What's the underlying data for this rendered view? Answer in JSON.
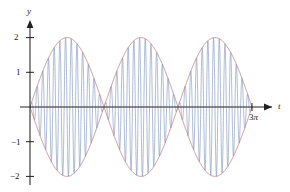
{
  "figure": {
    "background_color": "#ffffff",
    "axis_color": "#231f20",
    "envelope_color": "#c2807e",
    "carrier_color": "#7b92bb"
  },
  "axes": {
    "y_axis_label": "y",
    "x_axis_label": "t",
    "x_end_label_value": "3",
    "x_end_label_symbol": "π",
    "y_ticks": [
      {
        "label": "2",
        "value": 2
      },
      {
        "label": "1",
        "value": 1
      },
      {
        "label": "−1",
        "value": -1
      },
      {
        "label": "−2",
        "value": -2
      }
    ]
  },
  "chart_data": {
    "type": "line",
    "title": "",
    "xlabel": "t",
    "ylabel": "y",
    "xlim": [
      0,
      9.4248
    ],
    "ylim": [
      -2.2,
      2.2
    ],
    "grid": false,
    "legend": "none",
    "x_tick_labels": [
      "3π"
    ],
    "x_tick_values": [
      9.4248
    ],
    "y_tick_labels": [
      "2",
      "1",
      "-1",
      "-2"
    ],
    "y_tick_values": [
      2,
      1,
      -1,
      -2
    ],
    "series": [
      {
        "name": "upper-envelope",
        "color": "#c2807e",
        "formula": "y = 2*sin(t/3)... amplitude envelope, upper branch",
        "amplitude": 2,
        "packets": 3,
        "node_t_values": [
          0,
          3.1416,
          6.2832,
          9.4248
        ],
        "peak_t_values": [
          1.5708,
          4.7124,
          7.854
        ],
        "peak_values": [
          2,
          2,
          2
        ]
      },
      {
        "name": "lower-envelope",
        "color": "#c2807e",
        "formula": "y = -2 * |envelope|, lower branch",
        "amplitude": -2,
        "packets": 3,
        "node_t_values": [
          0,
          3.1416,
          6.2832,
          9.4248
        ],
        "trough_t_values": [
          1.5708,
          4.7124,
          7.854
        ],
        "trough_values": [
          -2,
          -2,
          -2
        ]
      },
      {
        "name": "carrier-oscillation",
        "color": "#7b92bb",
        "formula": "y = 2*sin(t)*sin(26t) approx (fast carrier inside envelope)",
        "carrier_cycles_per_packet": 26,
        "max_amplitude": 2,
        "min_amplitude": -2
      }
    ]
  }
}
